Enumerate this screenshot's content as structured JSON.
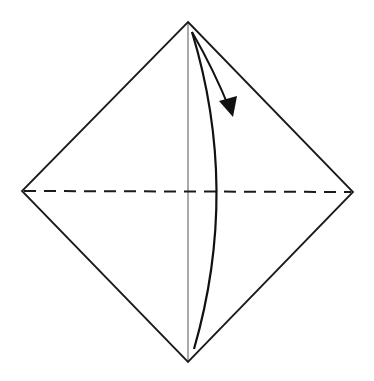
{
  "diagram": {
    "colors": {
      "background": "#ffffff",
      "outline": "#1a1a1a",
      "center_line": "#555555",
      "valley_fold": "#1a1a1a",
      "arrow": "#111111"
    },
    "shapes": {
      "diamond": {
        "top": [
          188,
          22
        ],
        "right": [
          353,
          192
        ],
        "bottom": [
          188,
          362
        ],
        "left": [
          22,
          191
        ]
      },
      "center_crease": {
        "from": [
          188,
          22
        ],
        "to": [
          188,
          362
        ]
      },
      "valley_fold_line": {
        "from": [
          22,
          191
        ],
        "to": [
          353,
          192
        ],
        "dash": "12 8"
      },
      "fold_arrow": {
        "start": [
          194,
          349
        ],
        "control": [
          240,
          190
        ],
        "end": [
          192,
          32
        ],
        "arrow_tip": [
          233,
          116
        ]
      }
    }
  }
}
